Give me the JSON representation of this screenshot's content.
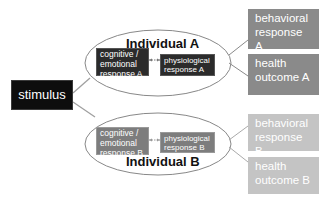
{
  "diagram": {
    "stimulus": {
      "label": "stimulus"
    },
    "individual_a": {
      "title": "Individual A",
      "cognitive": [
        "cognitive /",
        "emotional",
        "response A"
      ],
      "physiological": [
        "physiological",
        "response A"
      ],
      "bidirectional_arrow": "↔"
    },
    "individual_b": {
      "title": "Individual B",
      "cognitive": [
        "cognitive /",
        "emotional",
        "response B"
      ],
      "physiological": [
        "physiological",
        "response B"
      ],
      "bidirectional_arrow": "↔"
    },
    "outcomes_a": {
      "behavioral": [
        "behavioral",
        "response A"
      ],
      "health": [
        "health",
        "outcome A"
      ]
    },
    "outcomes_b": {
      "behavioral": [
        "behavioral",
        "response B"
      ],
      "health": [
        "health",
        "outcome B"
      ]
    },
    "colors": {
      "stimulus_fill": "#0d0d0d",
      "individual_a_inner": "#2b2b2b",
      "individual_b_inner": "#7d7d7d",
      "outcome_a_fill": "#8a8a8a",
      "outcome_b_fill": "#c4c4c4",
      "ellipse_stroke": "#888888",
      "connector": "#9a9a9a"
    }
  }
}
